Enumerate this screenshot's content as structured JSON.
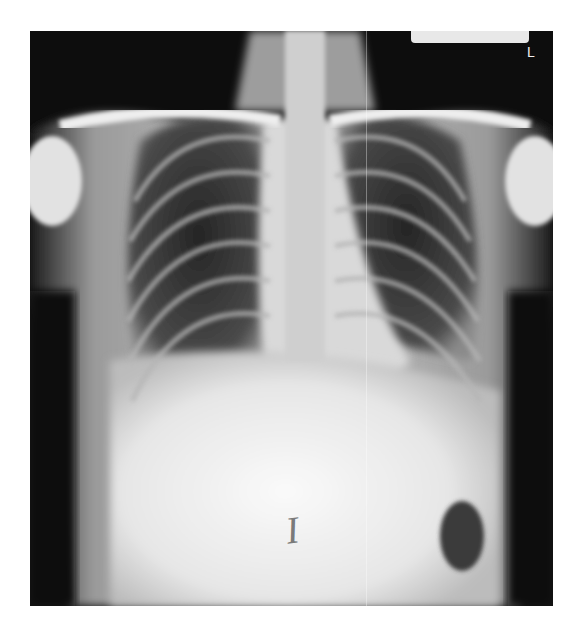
{
  "image": {
    "type": "chest-radiograph",
    "view": "PA",
    "side_marker": "L",
    "annotation_mark": "I",
    "colors": {
      "background": "#0d0d0d",
      "soft_tissue": "#bdbdbd",
      "bone": "#f2f2f2",
      "lung_field": "#2a2a2a",
      "label_box": "#e8e8e8"
    }
  }
}
